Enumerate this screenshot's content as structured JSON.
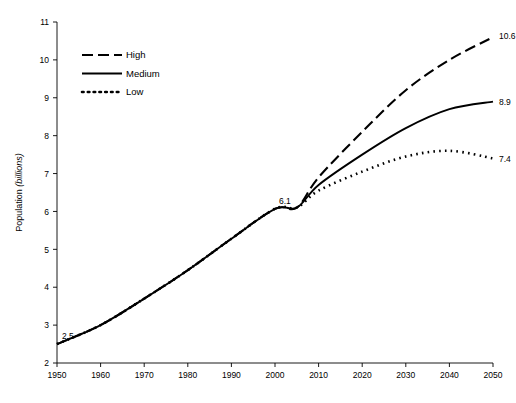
{
  "chart_data": {
    "type": "line",
    "title": "",
    "xlabel": "",
    "ylabel": "Population",
    "ylabel_unit": "(billions)",
    "xlim": [
      1950,
      2050
    ],
    "ylim": [
      2,
      11
    ],
    "grid": false,
    "legend_position": "top-left-inside",
    "x_ticks": [
      "1950",
      "1960",
      "1970",
      "1980",
      "1990",
      "2000",
      "2010",
      "2020",
      "2030",
      "2040",
      "2050"
    ],
    "y_ticks": [
      "2",
      "3",
      "4",
      "5",
      "6",
      "7",
      "8",
      "9",
      "10",
      "11"
    ],
    "x": [
      1950,
      1960,
      1970,
      1980,
      1990,
      2000,
      2005,
      2010,
      2020,
      2030,
      2040,
      2050
    ],
    "series": [
      {
        "name": "High",
        "style": "dashed",
        "values": [
          2.5,
          3.0,
          3.7,
          4.45,
          5.28,
          6.07,
          6.1,
          6.9,
          8.1,
          9.2,
          10.0,
          10.6
        ]
      },
      {
        "name": "Medium",
        "style": "solid",
        "values": [
          2.5,
          3.0,
          3.7,
          4.45,
          5.28,
          6.07,
          6.1,
          6.7,
          7.5,
          8.2,
          8.7,
          8.9
        ]
      },
      {
        "name": "Low",
        "style": "dotted",
        "values": [
          2.5,
          3.0,
          3.7,
          4.45,
          5.28,
          6.07,
          6.1,
          6.55,
          7.05,
          7.45,
          7.6,
          7.4
        ]
      }
    ],
    "annotations": [
      {
        "text": "2.5",
        "x": 1950,
        "y": 2.5
      },
      {
        "text": "6.1",
        "x": 2005,
        "y": 6.1
      },
      {
        "text": "10.6",
        "x": 2050,
        "y": 10.6
      },
      {
        "text": "8.9",
        "x": 2050,
        "y": 8.9
      },
      {
        "text": "7.4",
        "x": 2050,
        "y": 7.4
      }
    ],
    "legend": [
      {
        "label": "High",
        "style": "dashed"
      },
      {
        "label": "Medium",
        "style": "solid"
      },
      {
        "label": "Low",
        "style": "dotted"
      }
    ],
    "colors": {
      "line": "#000000",
      "axis": "#000000",
      "background": "#ffffff"
    }
  }
}
